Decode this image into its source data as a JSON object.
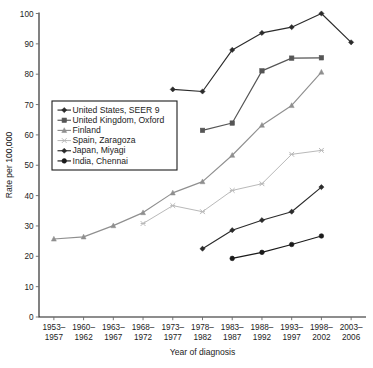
{
  "chart_data": {
    "type": "line",
    "title": "",
    "xlabel": "Year of diagnosis",
    "ylabel": "Rate per 100,000",
    "ylim": [
      0,
      100
    ],
    "yticks": [
      0,
      10,
      20,
      30,
      40,
      50,
      60,
      70,
      80,
      90,
      100
    ],
    "grid": false,
    "legend_position": "inside-left",
    "categories": [
      "1953–1957",
      "1960–1962",
      "1963–1967",
      "1968–1972",
      "1973–1977",
      "1978–1982",
      "1983–1987",
      "1988–1992",
      "1993–1997",
      "1998–2002",
      "2003–2006"
    ],
    "categories_display": [
      [
        "1953–",
        "1957"
      ],
      [
        "1960–",
        "1962"
      ],
      [
        "1963–",
        "1967"
      ],
      [
        "1968–",
        "1972"
      ],
      [
        "1973–",
        "1977"
      ],
      [
        "1978–",
        "1982"
      ],
      [
        "1983–",
        "1987"
      ],
      [
        "1988–",
        "1992"
      ],
      [
        "1993–",
        "1997"
      ],
      [
        "1998–",
        "2002"
      ],
      [
        "2003–",
        "2006"
      ]
    ],
    "series": [
      {
        "name": "United States, SEER 9",
        "color": "#2b2b2b",
        "marker": "diamond",
        "values": [
          null,
          null,
          null,
          null,
          75.0,
          74.3,
          88.0,
          93.6,
          95.5,
          100.0,
          90.5
        ]
      },
      {
        "name": "United Kingdom, Oxford",
        "color": "#555555",
        "marker": "square",
        "values": [
          null,
          null,
          null,
          null,
          null,
          61.5,
          63.9,
          81.1,
          85.3,
          85.4,
          null
        ]
      },
      {
        "name": "Finland",
        "color": "#8f8f8f",
        "marker": "triangle",
        "values": [
          25.7,
          26.4,
          30.1,
          34.4,
          40.9,
          44.6,
          53.3,
          63.2,
          69.7,
          80.7,
          null
        ]
      },
      {
        "name": "Spain, Zaragoza",
        "color": "#b9b9b9",
        "marker": "x",
        "values": [
          null,
          null,
          null,
          30.8,
          36.7,
          34.7,
          41.7,
          43.9,
          53.6,
          54.9,
          null
        ]
      },
      {
        "name": "Japan, Miyagi",
        "color": "#2b2b2b",
        "marker": "diamond",
        "values": [
          null,
          null,
          null,
          null,
          null,
          22.5,
          28.6,
          31.9,
          34.7,
          42.8,
          null
        ]
      },
      {
        "name": "India, Chennai",
        "color": "#1a1a1a",
        "marker": "circle",
        "values": [
          null,
          null,
          null,
          null,
          null,
          null,
          19.3,
          21.3,
          23.9,
          26.7,
          null
        ]
      }
    ]
  },
  "legend": {
    "items": [
      {
        "label": "United States, SEER 9"
      },
      {
        "label": "United Kingdom, Oxford"
      },
      {
        "label": "Finland"
      },
      {
        "label": "Spain, Zaragoza"
      },
      {
        "label": "Japan, Miyagi"
      },
      {
        "label": "India, Chennai"
      }
    ]
  },
  "axes": {
    "y_title": "Rate per 100,000",
    "x_title": "Year of diagnosis"
  }
}
